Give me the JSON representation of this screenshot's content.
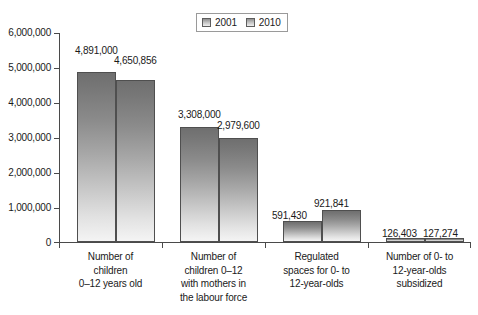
{
  "chart_data": {
    "type": "bar",
    "title": "",
    "xlabel": "",
    "ylabel": "",
    "ylim": [
      0,
      6000000
    ],
    "grid": false,
    "legend_position": "top-center",
    "categories": [
      "Number of\nchildren\n0–12 years old",
      "Number of\nchildren 0–12\nwith mothers in\nthe labour force",
      "Regulated\nspaces for 0- to\n12-year-olds",
      "Number of 0- to\n12-year-olds\nsubsidized"
    ],
    "tick_labels": [
      "0",
      "1,000,000",
      "2,000,000",
      "3,000,000",
      "4,000,000",
      "5,000,000",
      "6,000,000"
    ],
    "tick_values": [
      0,
      1000000,
      2000000,
      3000000,
      4000000,
      5000000,
      6000000
    ],
    "series": [
      {
        "name": "2001",
        "values": [
          4891000,
          3308000,
          591430,
          126403
        ],
        "labels": [
          "4,891,000",
          "3,308,000",
          "591,430",
          "126,403"
        ]
      },
      {
        "name": "2010",
        "values": [
          4650856,
          2979600,
          921841,
          127274
        ],
        "labels": [
          "4,650,856",
          "2,979,600",
          "921,841",
          "127,274"
        ]
      }
    ]
  },
  "legend": {
    "items": [
      {
        "label": "2001"
      },
      {
        "label": "2010"
      }
    ]
  },
  "axis": {
    "y_labels": [
      "6,000,000",
      "5,000,000",
      "4,000,000",
      "3,000,000",
      "2,000,000",
      "1,000,000",
      "0"
    ]
  },
  "categories": [
    {
      "line1": "Number of",
      "line2": "children",
      "line3": "0–12 years old",
      "line4": ""
    },
    {
      "line1": "Number of",
      "line2": "children 0–12",
      "line3": "with mothers in",
      "line4": "the labour force"
    },
    {
      "line1": "Regulated",
      "line2": "spaces for 0- to",
      "line3": "12-year-olds",
      "line4": ""
    },
    {
      "line1": "Number of 0- to",
      "line2": "12-year-olds",
      "line3": "subsidized",
      "line4": ""
    }
  ],
  "colors": {
    "bar_top": "#6f6f6f",
    "bar_bottom": "#f4f4f4",
    "bar_border": "#4f4f4f",
    "axis": "#4a4a4a",
    "text": "#1a1a1a",
    "background": "#ffffff"
  }
}
